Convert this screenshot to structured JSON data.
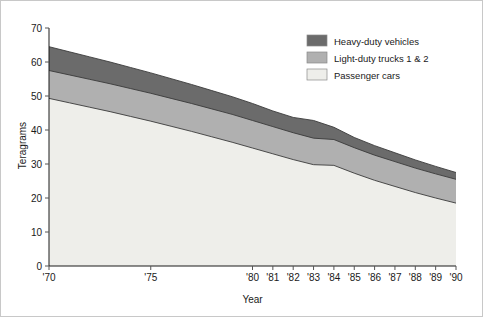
{
  "figure": {
    "border_color": "#c8c8c8",
    "background": "#ffffff"
  },
  "axes": {
    "xlabel": "Year",
    "ylabel": "Teragrams",
    "y_ticks": [
      "0",
      "10",
      "20",
      "30",
      "40",
      "50",
      "60",
      "70"
    ],
    "x_ticks": [
      "'70",
      "'75",
      "'80",
      "'81",
      "'82",
      "'83",
      "'84",
      "'85",
      "'86",
      "'87",
      "'88",
      "'89",
      "'90"
    ]
  },
  "legend": {
    "position": "top-right-inside",
    "items": [
      {
        "label": "Heavy-duty vehicles",
        "color": "#6b6b6b"
      },
      {
        "label": "Light-duty trucks 1 & 2",
        "color": "#b0b0b0"
      },
      {
        "label": "Passenger cars",
        "color": "#eeeeea"
      }
    ]
  },
  "chart_data": {
    "type": "area",
    "stacked": true,
    "title": "",
    "subtitle": "",
    "xlabel": "Year",
    "ylabel": "Teragrams",
    "xlim": [
      1970,
      1990
    ],
    "ylim": [
      0,
      70
    ],
    "y_tick_step": 10,
    "grid": false,
    "legend_position": "top-right-inside",
    "x_tick_labels": [
      "'70",
      "'75",
      "'80",
      "'81",
      "'82",
      "'83",
      "'84",
      "'85",
      "'86",
      "'87",
      "'88",
      "'89",
      "'90"
    ],
    "x": [
      1970,
      1971,
      1972,
      1973,
      1974,
      1975,
      1976,
      1977,
      1978,
      1979,
      1980,
      1981,
      1982,
      1983,
      1984,
      1985,
      1986,
      1987,
      1988,
      1989,
      1990
    ],
    "series": [
      {
        "name": "Passenger cars",
        "color": "#eeeeea",
        "stack_order": 1,
        "values": [
          49.3,
          48.0,
          46.7,
          45.4,
          44.0,
          42.6,
          41.1,
          39.6,
          38.0,
          36.4,
          34.7,
          33.0,
          31.3,
          29.8,
          29.6,
          27.3,
          25.2,
          23.4,
          21.6,
          20.0,
          18.5
        ]
      },
      {
        "name": "Light-duty trucks 1 & 2",
        "color": "#b0b0b0",
        "stack_order": 2,
        "values": [
          8.2,
          8.2,
          8.2,
          8.2,
          8.2,
          8.2,
          8.2,
          8.2,
          8.2,
          8.2,
          8.1,
          8.0,
          7.9,
          7.8,
          7.6,
          7.5,
          7.4,
          7.3,
          7.2,
          7.1,
          7.0
        ]
      },
      {
        "name": "Heavy-duty vehicles",
        "color": "#6b6b6b",
        "stack_order": 3,
        "values": [
          7.0,
          6.8,
          6.6,
          6.4,
          6.2,
          6.0,
          5.8,
          5.6,
          5.4,
          5.2,
          5.0,
          4.6,
          4.5,
          5.2,
          3.6,
          3.0,
          2.8,
          2.6,
          2.4,
          2.2,
          2.0
        ]
      }
    ],
    "cumulative_totals": {
      "passenger_cars_top": [
        49.3,
        48.0,
        46.7,
        45.4,
        44.0,
        42.6,
        41.1,
        39.6,
        38.0,
        36.4,
        34.7,
        33.0,
        31.3,
        29.8,
        29.6,
        27.3,
        25.2,
        23.4,
        21.6,
        20.0,
        18.5
      ],
      "light_duty_top": [
        57.5,
        56.2,
        54.9,
        53.6,
        52.2,
        50.8,
        49.3,
        47.8,
        46.2,
        44.6,
        42.8,
        41.0,
        39.2,
        37.6,
        37.2,
        34.8,
        32.6,
        30.7,
        28.8,
        27.1,
        25.5
      ],
      "heavy_duty_top": [
        64.5,
        63.0,
        61.5,
        60.0,
        58.4,
        56.8,
        55.1,
        53.4,
        51.6,
        49.8,
        47.8,
        45.6,
        43.7,
        42.8,
        40.8,
        37.8,
        35.4,
        33.3,
        31.2,
        29.3,
        27.5
      ]
    }
  }
}
